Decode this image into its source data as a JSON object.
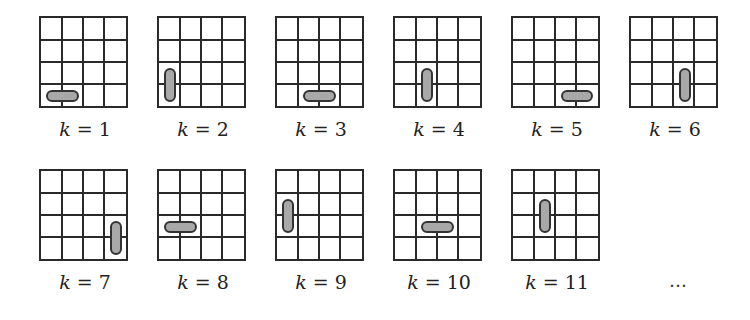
{
  "diagram": {
    "grid_size": 4,
    "panels": [
      {
        "k": 1,
        "label_var": "k",
        "label_eq": " = ",
        "label_num": "1",
        "orientation": "horizontal",
        "row": 3,
        "col": 0
      },
      {
        "k": 2,
        "label_var": "k",
        "label_eq": " = ",
        "label_num": "2",
        "orientation": "vertical",
        "row": 2,
        "col": 0
      },
      {
        "k": 3,
        "label_var": "k",
        "label_eq": " = ",
        "label_num": "3",
        "orientation": "horizontal",
        "row": 3,
        "col": 1
      },
      {
        "k": 4,
        "label_var": "k",
        "label_eq": " = ",
        "label_num": "4",
        "orientation": "vertical",
        "row": 2,
        "col": 1
      },
      {
        "k": 5,
        "label_var": "k",
        "label_eq": " = ",
        "label_num": "5",
        "orientation": "horizontal",
        "row": 3,
        "col": 2
      },
      {
        "k": 6,
        "label_var": "k",
        "label_eq": " = ",
        "label_num": "6",
        "orientation": "vertical",
        "row": 2,
        "col": 2
      },
      {
        "k": 7,
        "label_var": "k",
        "label_eq": " = ",
        "label_num": "7",
        "orientation": "vertical",
        "row": 2,
        "col": 3
      },
      {
        "k": 8,
        "label_var": "k",
        "label_eq": " = ",
        "label_num": "8",
        "orientation": "horizontal",
        "row": 2,
        "col": 0
      },
      {
        "k": 9,
        "label_var": "k",
        "label_eq": " = ",
        "label_num": "9",
        "orientation": "vertical",
        "row": 1,
        "col": 0
      },
      {
        "k": 10,
        "label_var": "k",
        "label_eq": " = ",
        "label_num": "10",
        "orientation": "horizontal",
        "row": 2,
        "col": 1
      },
      {
        "k": 11,
        "label_var": "k",
        "label_eq": " = ",
        "label_num": "11",
        "orientation": "vertical",
        "row": 1,
        "col": 1
      }
    ],
    "ellipsis": "…",
    "colors": {
      "line": "#2a2a2a",
      "domino_fill": "#bdbdbd",
      "domino_border": "#333333"
    }
  }
}
